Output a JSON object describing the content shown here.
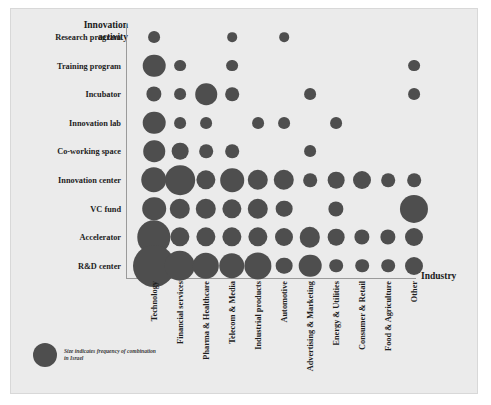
{
  "chart_data": {
    "type": "scatter",
    "title": "",
    "subtitle": "",
    "xlabel": "Industry",
    "ylabel": "Innovation\nactivity",
    "grid": false,
    "legend_position": "bottom-left",
    "legend_note": "Size indicates frequency of combination in Israel",
    "size_encoding": "Bubble area is proportional to the frequency of the industry / innovation-activity combination",
    "categories": [
      "Technology",
      "Financial services",
      "Pharma & Healthcare",
      "Telecom & Media",
      "Industrial products",
      "Automotive",
      "Advertising & Marketing",
      "Energy & Utilities",
      "Consumer & Retail",
      "Food & Agriculture",
      "Other"
    ],
    "rows": [
      "Research program",
      "Training program",
      "Incubator",
      "Innovation lab",
      "Co-working space",
      "Innovation center",
      "VC fund",
      "Accelerator",
      "R&D center"
    ],
    "series": [
      {
        "name": "Research program",
        "values": [
          3,
          0,
          0,
          2,
          0,
          2,
          0,
          0,
          0,
          0,
          0
        ]
      },
      {
        "name": "Training program",
        "values": [
          11,
          3,
          0,
          3,
          0,
          0,
          0,
          0,
          0,
          0,
          3
        ]
      },
      {
        "name": "Incubator",
        "values": [
          5,
          3,
          10,
          4,
          0,
          0,
          3,
          0,
          0,
          0,
          3
        ]
      },
      {
        "name": "Innovation lab",
        "values": [
          11,
          3,
          3,
          0,
          3,
          3,
          0,
          3,
          0,
          0,
          0
        ]
      },
      {
        "name": "Co-working space",
        "values": [
          10,
          6,
          4,
          4,
          0,
          0,
          3,
          0,
          0,
          0,
          0
        ]
      },
      {
        "name": "Innovation center",
        "values": [
          14,
          19,
          8,
          12,
          9,
          9,
          4,
          6,
          7,
          4,
          4
        ]
      },
      {
        "name": "VC fund",
        "values": [
          12,
          9,
          9,
          8,
          9,
          6,
          0,
          5,
          0,
          0,
          17
        ]
      },
      {
        "name": "Accelerator",
        "values": [
          24,
          8,
          8,
          8,
          8,
          7,
          9,
          6,
          5,
          5,
          7
        ]
      },
      {
        "name": "R&D center",
        "values": [
          38,
          20,
          15,
          14,
          16,
          6,
          11,
          4,
          4,
          4,
          7
        ]
      }
    ],
    "axis_note": "Matrix / bubble grid: 11 industry columns by 9 innovation-activity rows",
    "colors": {
      "bubble": "#4e4e4e",
      "background": "#ebebeb",
      "axis": "#9a9a9a",
      "text": "#1d1d1d"
    }
  },
  "axes": {
    "y_title": "Innovation\nactivity",
    "x_title": "Industry"
  },
  "legend": {
    "text": "Size indicates frequency of combination in Israel",
    "marker_name": "legend-bubble"
  }
}
